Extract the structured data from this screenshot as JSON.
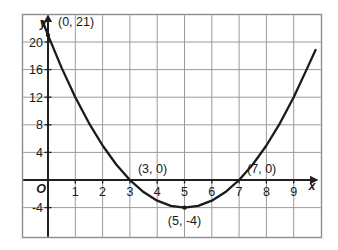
{
  "figure": {
    "kind": "coordinate-grid-parabola",
    "background_color": "#ffffff",
    "border_color": "#8d8d8d",
    "grid_color": "#9b9b9b",
    "axis_color": "#231f20",
    "curve_color": "#1a1a1a"
  },
  "chart_data": {
    "type": "line",
    "title": "",
    "subtitle": "",
    "xlabel": "x",
    "ylabel": "y",
    "equation": "y = x^2 - 10x + 21",
    "grid": true,
    "legend": "none",
    "xlim": [
      -1,
      10
    ],
    "ylim": [
      -6,
      24
    ],
    "x_ticks": [
      1,
      2,
      3,
      4,
      5,
      6,
      7,
      8,
      9
    ],
    "x_tick_labels": [
      "1",
      "2",
      "3",
      "4",
      "5",
      "6",
      "7",
      "8",
      "9"
    ],
    "y_ticks": [
      -4,
      4,
      8,
      12,
      16,
      20
    ],
    "y_tick_labels": [
      "-4",
      "4",
      "8",
      "12",
      "16",
      "20"
    ],
    "origin_label": "O",
    "x_grid_lines": [
      -1,
      0,
      1,
      2,
      3,
      4,
      5,
      6,
      7,
      8,
      9,
      10
    ],
    "y_grid_lines": [
      -4,
      0,
      4,
      8,
      12,
      16,
      20
    ],
    "series": [
      {
        "name": "y = x^2 - 10x + 21",
        "x": [
          -0.2,
          0,
          0.5,
          1,
          1.5,
          2,
          2.5,
          3,
          3.5,
          4,
          4.5,
          5,
          5.5,
          6,
          6.5,
          7,
          7.5,
          8,
          8.5,
          9,
          9.5,
          9.8
        ],
        "values": [
          23.04,
          21,
          16.25,
          12,
          8.25,
          5,
          2.25,
          0,
          -1.75,
          -3,
          -3.75,
          -4,
          -3.75,
          -3,
          -1.75,
          0,
          2.25,
          5,
          8.25,
          12,
          16.25,
          18.84
        ]
      }
    ],
    "annotated_points": [
      {
        "name": "y-intercept",
        "label": "(0, 21)",
        "x": 0,
        "y": 21,
        "marker": true,
        "label_dx": 10,
        "label_dy": -9
      },
      {
        "name": "left-root",
        "label": "(3, 0)",
        "x": 3,
        "y": 0,
        "marker": false,
        "label_dx": 8,
        "label_dy": -7
      },
      {
        "name": "right-root",
        "label": "(7, 0)",
        "x": 7,
        "y": 0,
        "marker": false,
        "label_dx": 8,
        "label_dy": -7
      },
      {
        "name": "vertex",
        "label": "(5, -4)",
        "x": 5,
        "y": -4,
        "marker": true,
        "label_dx": 0,
        "label_dy": 17
      }
    ]
  }
}
